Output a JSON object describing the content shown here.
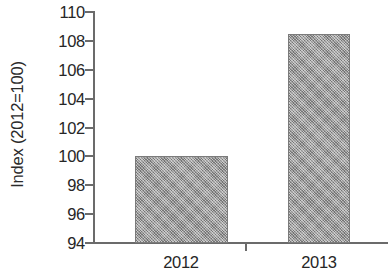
{
  "chart_data": {
    "type": "bar",
    "title": "",
    "subtitle": "",
    "xlabel": "",
    "ylabel": "Index (2012=100)",
    "categories": [
      "2012",
      "2013"
    ],
    "values": [
      100,
      108.5
    ],
    "series": [
      {
        "name": "Index (2012=100)",
        "values": [
          100,
          108.5
        ]
      }
    ],
    "ylim": [
      94,
      110
    ],
    "y_ticks": [
      94,
      96,
      98,
      100,
      102,
      104,
      106,
      108,
      110
    ],
    "y_tick_labels": [
      "94",
      "96",
      "98",
      "100",
      "102",
      "104",
      "106",
      "108",
      "110"
    ],
    "x_tick_labels": [
      "2012",
      "2013"
    ],
    "grid": false,
    "legend": false,
    "legend_position": "none",
    "annotations": [],
    "colors": {
      "bar_fill": "#949494",
      "bar_edge": "#7b7b7b",
      "axis": "#6b6b6b",
      "text": "#262626",
      "background": "#ffffff"
    }
  }
}
